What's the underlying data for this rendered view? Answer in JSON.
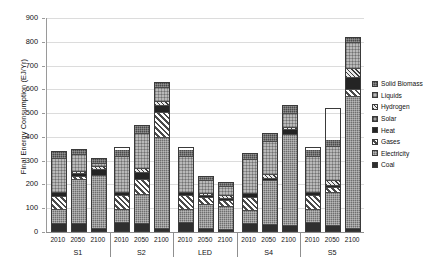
{
  "chart_data": {
    "type": "bar",
    "title": "",
    "xlabel": "",
    "ylabel": "Final Energy Consumption (EJ/Yr)",
    "ylim": [
      0,
      900
    ],
    "ytick_step": 100,
    "yticks": [
      0,
      100,
      200,
      300,
      400,
      500,
      600,
      700,
      800,
      900
    ],
    "ytick_labels": [
      "0",
      "100",
      "200",
      "300",
      "400",
      "500",
      "600",
      "700",
      "800",
      "900"
    ],
    "grid": true,
    "stacked": true,
    "legend_position": "right",
    "groups": [
      "S1",
      "S2",
      "LED",
      "S4",
      "S5"
    ],
    "subcategories": [
      "2010",
      "2050",
      "2100"
    ],
    "categories": [
      "S1 2010",
      "S1 2050",
      "S1 2100",
      "S2 2010",
      "S2 2050",
      "S2 2100",
      "LED 2010",
      "LED 2050",
      "LED 2100",
      "S4 2010",
      "S4 2050",
      "S4 2100",
      "S5 2010",
      "S5 2050",
      "S5 2100"
    ],
    "series": [
      {
        "name": "Coal",
        "fill": "f-coal",
        "color": "#2f2f2f",
        "values": [
          32,
          30,
          8,
          32,
          30,
          8,
          32,
          10,
          6,
          32,
          24,
          20,
          32,
          22,
          10
        ]
      },
      {
        "name": "Electricity",
        "fill": "f-electricity",
        "color": "#6e6e6e",
        "values": [
          58,
          190,
          238,
          58,
          125,
          400,
          58,
          105,
          95,
          58,
          190,
          390,
          58,
          140,
          560
        ]
      },
      {
        "name": "Gases",
        "fill": "f-gases",
        "color": "#8d8d8d",
        "values": [
          58,
          12,
          0,
          58,
          62,
          110,
          58,
          30,
          28,
          58,
          0,
          0,
          58,
          18,
          30
        ]
      },
      {
        "name": "Heat",
        "fill": "f-heat",
        "color": "#242424",
        "values": [
          14,
          12,
          26,
          14,
          30,
          30,
          14,
          8,
          8,
          14,
          10,
          20,
          14,
          10,
          50
        ]
      },
      {
        "name": "Solar",
        "fill": "f-solar",
        "color": "#9e9e9e",
        "values": [
          0,
          0,
          0,
          0,
          0,
          0,
          0,
          0,
          0,
          0,
          0,
          0,
          0,
          0,
          0
        ]
      },
      {
        "name": "Hydrogen",
        "fill": "f-hydrogen",
        "color": "#e9e9e9",
        "values": [
          0,
          10,
          12,
          0,
          18,
          18,
          0,
          8,
          10,
          0,
          18,
          10,
          0,
          22,
          40
        ]
      },
      {
        "name": "Liquids",
        "fill": "f-liquids",
        "color": "#b9b9b9",
        "values": [
          150,
          72,
          14,
          150,
          150,
          60,
          150,
          55,
          38,
          150,
          140,
          60,
          150,
          140,
          110
        ]
      },
      {
        "name": "Solid Biomass",
        "fill": "f-biomass",
        "color": "#4a4a4a",
        "values": [
          30,
          24,
          22,
          30,
          35,
          22,
          30,
          20,
          18,
          30,
          35,
          35,
          30,
          30,
          20
        ]
      }
    ],
    "totals": [
      342,
      350,
      312,
      358,
      450,
      630,
      358,
      236,
      210,
      334,
      417,
      535,
      358,
      520,
      820
    ]
  },
  "legend": {
    "items": [
      {
        "label": "Solid Biomass",
        "fill": "f-biomass"
      },
      {
        "label": "Liquids",
        "fill": "f-liquids"
      },
      {
        "label": "Hydrogen",
        "fill": "f-hydrogen"
      },
      {
        "label": "Solar",
        "fill": "f-solar"
      },
      {
        "label": "Heat",
        "fill": "f-heat"
      },
      {
        "label": "Gases",
        "fill": "f-gases"
      },
      {
        "label": "Electricity",
        "fill": "f-electricity"
      },
      {
        "label": "Coal",
        "fill": "f-coal"
      }
    ]
  }
}
